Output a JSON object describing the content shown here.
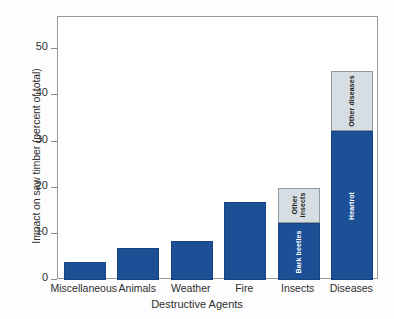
{
  "chart_data": {
    "type": "bar",
    "title": "",
    "subtitle": "",
    "xlabel": "Destructive Agents",
    "ylabel": "Impact on saw timber (percent of total)",
    "ylim": [
      0,
      57
    ],
    "yticks": [
      0,
      10,
      20,
      30,
      40,
      50
    ],
    "ytick_labels": [
      "0",
      "10",
      "20",
      "30",
      "40",
      "50"
    ],
    "grid": false,
    "legend": "none",
    "stacked": true,
    "categories": [
      "Miscellaneous",
      "Animals",
      "Weather",
      "Fire",
      "Insects",
      "Diseases"
    ],
    "values": [
      3.9,
      6.9,
      8.4,
      16.8,
      20.0,
      45.2
    ],
    "series": [
      {
        "name": "Primary",
        "color": "#1b4f96",
        "values": [
          3.9,
          6.9,
          8.4,
          16.8,
          12.3,
          32.2
        ],
        "segment_labels": [
          "",
          "",
          "",
          "",
          "Bark beetles",
          "Heartrot"
        ]
      },
      {
        "name": "Other",
        "color": "#d6dde3",
        "values": [
          0,
          0,
          0,
          0,
          7.7,
          13.0
        ],
        "segment_labels": [
          "",
          "",
          "",
          "",
          "Other insects",
          "Other diseases"
        ]
      }
    ],
    "annotations": [
      {
        "category": "Insects",
        "segment": "Primary",
        "text": "Bark beetles"
      },
      {
        "category": "Insects",
        "segment": "Other",
        "text": "Other insects"
      },
      {
        "category": "Diseases",
        "segment": "Primary",
        "text": "Heartrot"
      },
      {
        "category": "Diseases",
        "segment": "Other",
        "text": "Other diseases"
      }
    ],
    "colors": {
      "bar_primary": "#1b4f96",
      "bar_other": "#d6dde3",
      "bar_primary_edge": "#17437f",
      "bar_other_edge": "#8f9aa3",
      "axis": "#9a9a9a",
      "text": "#2e2e2e",
      "background": "#fdfdfd",
      "plot_background": "#ffffff"
    }
  },
  "axis": {
    "y": {
      "ticks": [
        {
          "label": "50"
        },
        {
          "label": "40"
        },
        {
          "label": "30"
        },
        {
          "label": "20"
        },
        {
          "label": "10"
        },
        {
          "label": "0"
        }
      ]
    },
    "x": {
      "ticks": [
        {
          "label": "Miscellaneous"
        },
        {
          "label": "Animals"
        },
        {
          "label": "Weather"
        },
        {
          "label": "Fire"
        },
        {
          "label": "Insects"
        },
        {
          "label": "Diseases"
        }
      ]
    }
  },
  "bars": [
    {
      "category": "Miscellaneous",
      "total": 3.9,
      "segments": [
        {
          "kind": "blue",
          "value": 3.9,
          "label": ""
        }
      ]
    },
    {
      "category": "Animals",
      "total": 6.9,
      "segments": [
        {
          "kind": "blue",
          "value": 6.9,
          "label": ""
        }
      ]
    },
    {
      "category": "Weather",
      "total": 8.4,
      "segments": [
        {
          "kind": "blue",
          "value": 8.4,
          "label": ""
        }
      ]
    },
    {
      "category": "Fire",
      "total": 16.8,
      "segments": [
        {
          "kind": "blue",
          "value": 16.8,
          "label": ""
        }
      ]
    },
    {
      "category": "Insects",
      "total": 20.0,
      "segments": [
        {
          "kind": "blue",
          "value": 12.3,
          "label": "Bark beetles"
        },
        {
          "kind": "gray",
          "value": 7.7,
          "label": "Other\ninsects"
        }
      ]
    },
    {
      "category": "Diseases",
      "total": 45.2,
      "segments": [
        {
          "kind": "blue",
          "value": 32.2,
          "label": "Heartrot"
        },
        {
          "kind": "gray",
          "value": 13.0,
          "label": "Other diseases"
        }
      ]
    }
  ]
}
